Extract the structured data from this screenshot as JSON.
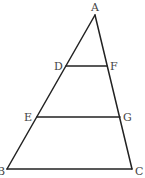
{
  "diagram": {
    "type": "triangle-with-parallel-segments",
    "stroke_color": "#222222",
    "label_color": "#444444",
    "points": {
      "A": {
        "x": 95,
        "y": 15,
        "label": "A"
      },
      "B": {
        "x": 7,
        "y": 169,
        "label": "B"
      },
      "C": {
        "x": 132,
        "y": 169,
        "label": "C"
      },
      "D": {
        "x": 66,
        "y": 66,
        "label": "D"
      },
      "F": {
        "x": 107,
        "y": 66,
        "label": "F"
      },
      "E": {
        "x": 37,
        "y": 117,
        "label": "E"
      },
      "G": {
        "x": 120,
        "y": 117,
        "label": "G"
      }
    },
    "segments": [
      {
        "from": "A",
        "to": "B"
      },
      {
        "from": "A",
        "to": "C"
      },
      {
        "from": "B",
        "to": "C"
      },
      {
        "from": "D",
        "to": "F"
      },
      {
        "from": "E",
        "to": "G"
      }
    ]
  }
}
